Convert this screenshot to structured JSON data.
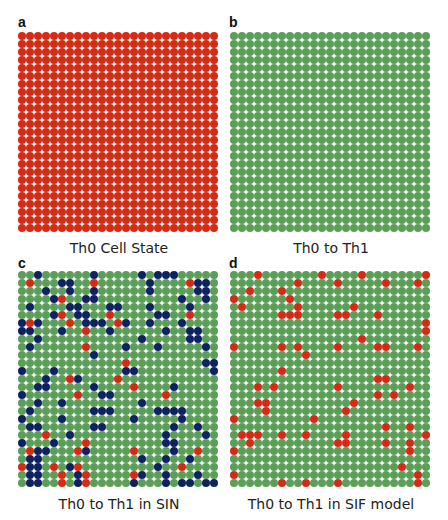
{
  "colors": {
    "R": "#d52b15",
    "G": "#5b9e58",
    "B": "#0e2262"
  },
  "panels": [
    {
      "letter": "a",
      "caption": "Th0 Cell State",
      "rows": 25,
      "cols": 25,
      "fill": "R"
    },
    {
      "letter": "b",
      "caption": "Th0 to Th1",
      "rows": 25,
      "cols": 25,
      "fill": "G"
    },
    {
      "letter": "c",
      "caption": "Th0 to Th1 in SIN",
      "rows": 27,
      "cols": 25,
      "pattern": [
        "GGBGGGGGGBGGGGGBGBBBGGGGG",
        "GRGGGBBGGRGGGGGGBGGGGRBBG",
        "GGGBGGBGGBGGGGGGBGGGGGBBG",
        "GGGGBRGGBBGGGGGGGGGGBGGBG",
        "GBGGGGBBGGGBBGGGBGGGGBGGG",
        "GGGGBRGBBGGRGGGGGBBGGRGGG",
        "BRBGGGRGBBBGRBGGBGGGBGGGG",
        "BBGGGBGGRGGBGGGGGGBGGBBGG",
        "GGBGGGGGGGGGGGGBGGGGGBBGG",
        "GBGGGGGGRGGGGBGGGBGGGGGBG",
        "GGGGGGGGGBGGGGGGGGGGGGGGG",
        "GGGGGGGGGGGGGRGGGGGGGGGBB",
        "BGGGBGGGGGGGGBBGGGGGGGGGB",
        "GGGBGGRBGGGGRGGGGGGGGGGGG",
        "GGBBGGGGGBGGGGRGGGGBGGGGG",
        "BGGGGGGRGGBBGGGGGGRGGGGGG",
        "GGBGGBGGGGGGGGGBGGGGGGGGG",
        "GBGGGGGGGBBBGGGGGBBBBGGGG",
        "BGGGGBGGGGGGGGBGGGGGBGGGG",
        "GBBGGGGGGBBGGGGGGGGBGGBGG",
        "GGGRGGBGGGGGGGGGGGBGGGGBG",
        "BGGGBGGGRGGGGGGGGGBBGGGGG",
        "GRBBGGGRBGGGGGRGGGGBGGRGG",
        "GBBGGGGGGGGGGGGBGGBGGBGGG",
        "RBBGRGBRGGGGGGGGGBGGRGGGG",
        "GBBGGRGBRGGGGGRBGGBGGGBGG",
        "GBBGGRGBRGGGGGBGGGBGBBGBB"
      ]
    },
    {
      "letter": "d",
      "caption": "Th0 to Th1 in SIF model",
      "rows": 27,
      "cols": 25,
      "pattern": [
        "GGGRGGGGGGGRGGGGRGGGGGGGR",
        "GGGGGGGGRGGGGRGGGGGRGGGRG",
        "GGRGGGRGGGGGGGGGGGGGGGGGG",
        "RGGGGGGRGGGGGGGGGGGGGGGGG",
        "GRGGGGGGRGGGGGGRGGGGGGGGG",
        "GGGGGGRRRGGGGRRGGGRGGGGGG",
        "GGGGGGGGGGGGGGGGGGGGGGGGR",
        "GGGGGGGGGGGGGGGGGGGGGGGGR",
        "GGGGGGGGGGGGGGGGRGGGGGGGG",
        "RGGGGGRGRGGGGRGGGGRRGGGRG",
        "GGGGGGGGGRGGGGGGGGGGGGGGG",
        "GGGGGGGGGGGGGGGGGGGGGGGGG",
        "GGGGGGRGGGGGGGGGGGGGGGGGG",
        "GGGGGGGGGGGGGGGGGGRRGGGGG",
        "GGGRGRGGGGGGGRGGGGGGGGRGG",
        "GGGGGGGGGGGGGGGGGGRGRGGGG",
        "GGGRRGGGGGGGGGGRGGGGGGGGG",
        "GGGGRGGGGGGGGGRGGGGGGGGGG",
        "RGGGGGGGGGRGGGGGGGGGGGGGG",
        "GGGGGGGGGGGGGGGGGGGRGGRGG",
        "GRRRGGRGGRGGGGRGGGGGGGGGR",
        "GGRGGGGGGGGGGRRGGGGRGGRGG",
        "RGGGGGGGGGGGGGGGGGGGGGRGG",
        "GGGGGGGGGGGGGGGGGGGGGGGGG",
        "GGGGGGGGGGGGGGGGGGGGGRGGG",
        "RGGGGGGGGGGGGGGGGGGGGGGRG",
        "GGGGGGRGGRGGGRGGGGGGGGGRG"
      ]
    }
  ],
  "chart_data": {
    "type": "heatmap",
    "title": "",
    "legend": {
      "R": "Th0 (red)",
      "G": "Th1 (green)",
      "B": "other / blue state"
    },
    "panels": [
      {
        "label": "a",
        "caption": "Th0 Cell State",
        "grid": "25x25",
        "content": "all red (Th0)"
      },
      {
        "label": "b",
        "caption": "Th0 to Th1",
        "grid": "25x25",
        "content": "all green (Th1)"
      },
      {
        "label": "c",
        "caption": "Th0 to Th1 in SIN",
        "grid": "25x27",
        "content": "mostly green with scattered navy and few red cells"
      },
      {
        "label": "d",
        "caption": "Th0 to Th1 in SIF model",
        "grid": "25x27",
        "content": "mostly green with scattered red cells"
      }
    ]
  }
}
